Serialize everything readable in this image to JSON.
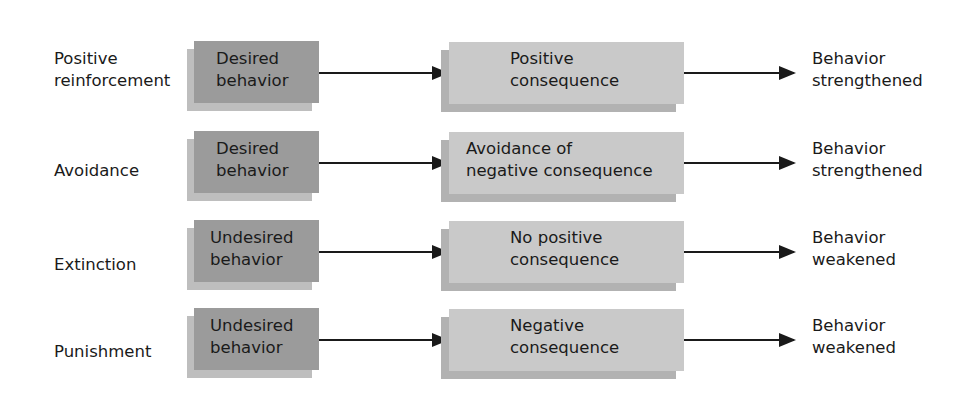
{
  "diagram": {
    "type": "behavior-reinforcement-flow",
    "colors": {
      "behavior_box": "#9b9b9b",
      "consequence_box": "#c9c9c9",
      "arrow": "#1a1a1a",
      "text": "#1a1a1a"
    },
    "rows": [
      {
        "type": "Positive reinforcement",
        "type_lines": [
          "Positive",
          "reinforcement"
        ],
        "behavior_lines": [
          "Desired",
          "behavior"
        ],
        "consequence_lines": [
          "Positive",
          "consequence"
        ],
        "result_lines": [
          "Behavior",
          "strengthened"
        ]
      },
      {
        "type": "Avoidance",
        "type_lines": [
          "Avoidance"
        ],
        "behavior_lines": [
          "Desired",
          "behavior"
        ],
        "consequence_lines": [
          "Avoidance of",
          "negative consequence"
        ],
        "result_lines": [
          "Behavior",
          "strengthened"
        ]
      },
      {
        "type": "Extinction",
        "type_lines": [
          "Extinction"
        ],
        "behavior_lines": [
          "Undesired",
          "behavior"
        ],
        "consequence_lines": [
          "No positive",
          "consequence"
        ],
        "result_lines": [
          "Behavior",
          "weakened"
        ]
      },
      {
        "type": "Punishment",
        "type_lines": [
          "Punishment"
        ],
        "behavior_lines": [
          "Undesired",
          "behavior"
        ],
        "consequence_lines": [
          "Negative",
          "consequence"
        ],
        "result_lines": [
          "Behavior",
          "weakened"
        ]
      }
    ]
  }
}
